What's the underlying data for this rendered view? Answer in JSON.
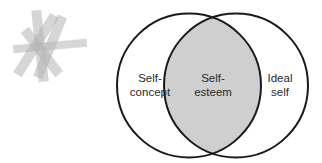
{
  "diagram": {
    "type": "venn",
    "circles": [
      {
        "id": "self-concept",
        "label_lines": [
          "Self-",
          "concept"
        ]
      },
      {
        "id": "ideal-self",
        "label_lines": [
          "Ideal",
          "self"
        ]
      }
    ],
    "intersection": {
      "label_lines": [
        "Self-",
        "esteem"
      ]
    },
    "colors": {
      "outline": "#1a1a1a",
      "intersection_fill": "#cfcfcf",
      "text": "#2a2a2a",
      "decoration": "#b8b8b8"
    }
  },
  "decoration": {
    "icon": "asterisk-strips-icon"
  }
}
